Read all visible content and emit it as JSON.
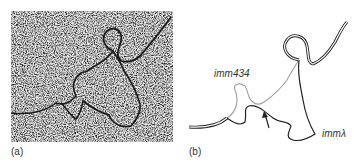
{
  "figure": {
    "panel_a": {
      "label": "(a)",
      "content": "electron micrograph of DNA heteroduplex"
    },
    "panel_b": {
      "label": "(b)",
      "annotations": {
        "strand_top": "imm434",
        "strand_right": "immλ"
      },
      "arrow": "arrow-pointing-to-junction"
    }
  },
  "colors": {
    "micrograph_bg": "#b8b8b8",
    "strand_dark": "#222222",
    "strand_light": "#999999"
  }
}
